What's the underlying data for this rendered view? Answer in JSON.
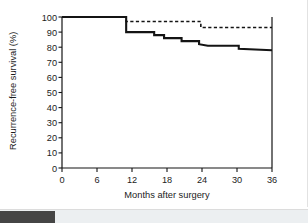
{
  "chart_data": {
    "type": "line",
    "title": "",
    "xlabel": "Months after surgery",
    "ylabel": "Recurrence-free survival (%)",
    "xlim": [
      0,
      36
    ],
    "ylim": [
      0,
      100
    ],
    "xticks": [
      "0",
      "6",
      "12",
      "18",
      "24",
      "30",
      "36"
    ],
    "yticks": [
      "0",
      "10",
      "20",
      "30",
      "40",
      "50",
      "60",
      "70",
      "80",
      "90",
      "100"
    ],
    "grid": false,
    "legend_position": "none",
    "step_interpolation": "post",
    "series": [
      {
        "name": "solid-curve",
        "style": "solid",
        "color": "#141414",
        "x": [
          0,
          11.0,
          11.0,
          15.8,
          17.5,
          20.5,
          23.5,
          25.0,
          30.3,
          36.0
        ],
        "y": [
          100,
          100,
          90,
          90,
          88,
          86,
          84,
          81,
          79,
          78
        ],
        "points": [
          {
            "x": 0,
            "y": 100
          },
          {
            "x": 11.0,
            "y": 100
          },
          {
            "x": 11.0,
            "y": 90
          },
          {
            "x": 15.8,
            "y": 90
          },
          {
            "x": 15.8,
            "y": 88
          },
          {
            "x": 17.5,
            "y": 88
          },
          {
            "x": 17.5,
            "y": 86
          },
          {
            "x": 20.5,
            "y": 86
          },
          {
            "x": 20.5,
            "y": 84
          },
          {
            "x": 23.5,
            "y": 84
          },
          {
            "x": 23.5,
            "y": 82
          },
          {
            "x": 25.0,
            "y": 81
          },
          {
            "x": 30.3,
            "y": 81
          },
          {
            "x": 30.3,
            "y": 79
          },
          {
            "x": 36.0,
            "y": 78
          }
        ]
      },
      {
        "name": "dashed-curve",
        "style": "dashed",
        "color": "#141414",
        "x": [
          0,
          11.0,
          11.0,
          23.8,
          23.8,
          36.0
        ],
        "y": [
          100,
          100,
          97,
          97,
          93,
          93
        ],
        "points": [
          {
            "x": 0,
            "y": 100
          },
          {
            "x": 11.0,
            "y": 100
          },
          {
            "x": 11.0,
            "y": 97
          },
          {
            "x": 23.8,
            "y": 97
          },
          {
            "x": 23.8,
            "y": 93
          },
          {
            "x": 36.0,
            "y": 93
          }
        ]
      }
    ]
  },
  "scrollbar": {
    "orientation": "horizontal",
    "thumb_position_percent": 0,
    "thumb_color": "#454545",
    "track_color": "#eceff1"
  }
}
